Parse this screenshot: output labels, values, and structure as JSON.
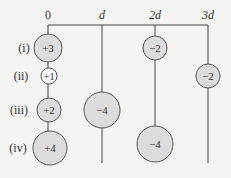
{
  "axis": {
    "positions": [
      {
        "label": "0",
        "x": 48
      },
      {
        "label": "d",
        "x": 102
      },
      {
        "label": "2d",
        "x": 155
      },
      {
        "label": "3d",
        "x": 208
      }
    ]
  },
  "rows": [
    {
      "label": "(i)",
      "y": 48
    },
    {
      "label": "(ii)",
      "y": 76
    },
    {
      "label": "(iii)",
      "y": 110
    },
    {
      "label": "(iv)",
      "y": 148
    }
  ],
  "charges": [
    {
      "id": "c-i-0",
      "value": "+3",
      "cx": 48,
      "cy": 48,
      "r": 14,
      "fill": "#dcdcdc"
    },
    {
      "id": "c-i-2d",
      "value": "−2",
      "cx": 155,
      "cy": 48,
      "r": 12,
      "fill": "#dcdcdc"
    },
    {
      "id": "c-ii-0",
      "value": "+1",
      "cx": 49,
      "cy": 76,
      "r": 8,
      "fill": "#ffffff"
    },
    {
      "id": "c-ii-3d",
      "value": "−2",
      "cx": 208,
      "cy": 76,
      "r": 12,
      "fill": "#dcdcdc"
    },
    {
      "id": "c-iii-0",
      "value": "+2",
      "cx": 49,
      "cy": 110,
      "r": 12,
      "fill": "#dcdcdc"
    },
    {
      "id": "c-iii-d",
      "value": "−4",
      "cx": 102,
      "cy": 110,
      "r": 18,
      "fill": "#dcdcdc"
    },
    {
      "id": "c-iv-0",
      "value": "+4",
      "cx": 50,
      "cy": 148,
      "r": 17,
      "fill": "#dcdcdc"
    },
    {
      "id": "c-iv-2d",
      "value": "−4",
      "cx": 155,
      "cy": 144,
      "r": 18,
      "fill": "#dcdcdc"
    }
  ],
  "colors": {
    "line": "#444444",
    "stroke": "#555555",
    "background": "#f4f4f2"
  }
}
